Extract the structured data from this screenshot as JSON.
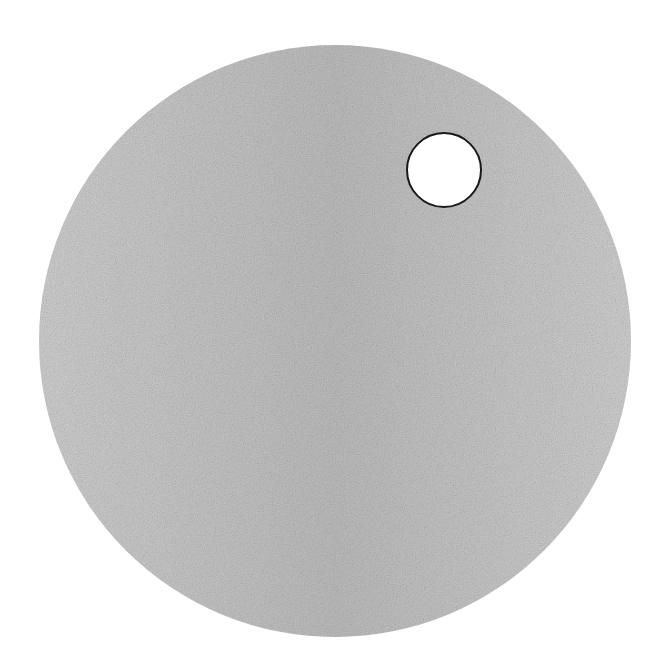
{
  "scene": {
    "background": "#ffffff",
    "disc": {
      "cx": 335,
      "cy": 341,
      "r": 296,
      "fill": "#bdbdbd",
      "shade_light": "#cfcfcf",
      "shade_dark": "#a9a9a9"
    },
    "hole": {
      "cx": 444,
      "cy": 170,
      "r": 37,
      "fill": "#ffffff",
      "stroke": "#1a1a1a",
      "stroke_width": 2
    }
  }
}
